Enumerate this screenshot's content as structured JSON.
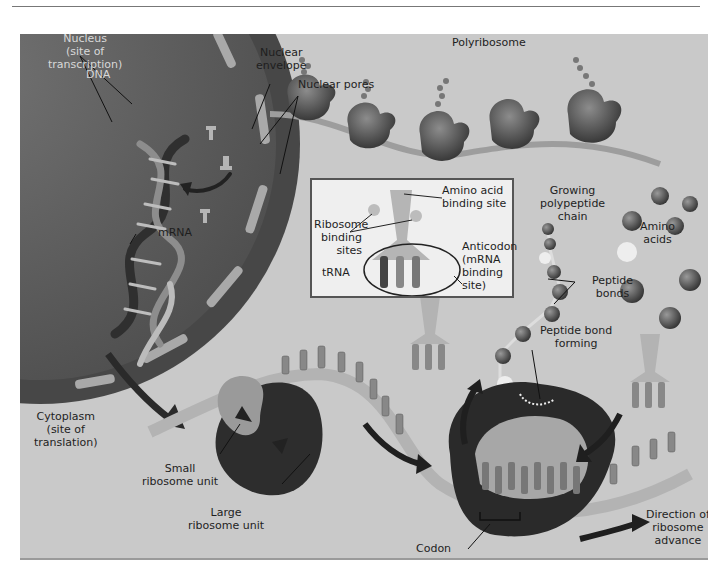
{
  "header": {
    "caption_fragment": "",
    "rule": true
  },
  "figure": {
    "colors": {
      "background": "#c9c9c9",
      "nucleus": "#5e5e5e",
      "nuclear_envelope": "#4a4a4a",
      "nuclear_pore": "#a8a8a8",
      "ribosome_dark": "#3a3a3a",
      "ribosome_light": "#9a9a9a",
      "mrna_strand": "#b4b4b4",
      "inset_background": "#efefef"
    },
    "labels": {
      "nucleus": [
        "Nucleus",
        "(site of",
        "transcription)"
      ],
      "dna": "DNA",
      "mrna": "mRNA",
      "nuclear_envelope": [
        "Nuclear",
        "envelope"
      ],
      "nuclear_pores": "Nuclear pores",
      "polyribosome": "Polyribosome",
      "growing_chain": [
        "Growing",
        "polypeptide",
        "chain"
      ],
      "amino_acids": [
        "Amino",
        "acids"
      ],
      "peptide_bonds": [
        "Peptide",
        "bonds"
      ],
      "peptide_bond_forming": [
        "Peptide bond",
        "forming"
      ],
      "cytoplasm": [
        "Cytoplasm",
        "(site of",
        "translation)"
      ],
      "small_ribosome": [
        "Small",
        "ribosome unit"
      ],
      "large_ribosome": [
        "Large",
        "ribosome unit"
      ],
      "codon": "Codon",
      "direction": [
        "Direction of",
        "ribosome",
        "advance"
      ]
    },
    "inset": {
      "title": "tRNA",
      "amino_acid_site": [
        "Amino acid",
        "binding site"
      ],
      "ribosome_sites": [
        "Ribosome",
        "binding",
        "sites"
      ],
      "anticodon": [
        "Anticodon",
        "(mRNA",
        "binding",
        "site)"
      ]
    },
    "bases": {
      "mrna_top": [
        "A",
        "U",
        "A",
        "G",
        "A",
        "A",
        "U",
        "A",
        "U",
        "A"
      ],
      "codon_row": [
        "U",
        "A",
        "C",
        "U",
        "A",
        "U",
        "C",
        "U"
      ],
      "free_trna_anticodon": [
        "A",
        "U",
        "G"
      ]
    }
  }
}
